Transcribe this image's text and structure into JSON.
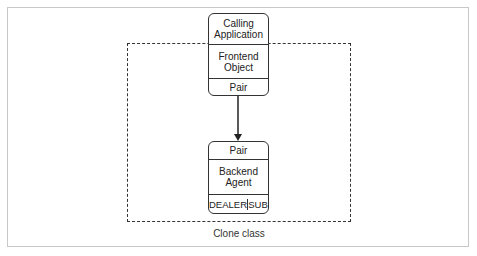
{
  "diagram": {
    "container_label": "Clone class",
    "frontend_node": {
      "sections": [
        "Calling\nApplication",
        "Frontend\nObject",
        "Pair"
      ]
    },
    "backend_node": {
      "sections": [
        "Pair",
        "Backend\nAgent"
      ],
      "sockets": [
        "DEALER",
        "SUB"
      ]
    },
    "connector": {
      "from": "frontend_node.Pair",
      "to": "backend_node.Pair",
      "style": "arrow"
    },
    "colors": {
      "stroke": "#333333",
      "frame": "#c8c8c8",
      "background": "#ffffff"
    }
  }
}
